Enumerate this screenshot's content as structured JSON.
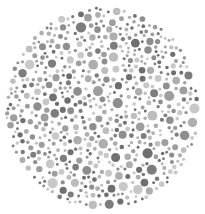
{
  "image": {
    "subject": "Ishihara-style dot plate (grayscale)",
    "caption": "Circular color-vision test plate made of gray dots",
    "width": 205,
    "height": 214
  },
  "plate": {
    "center_x": 102.5,
    "center_y": 108,
    "radius_x": 98,
    "radius_y": 102,
    "background": "#ffffff",
    "dot_colors": [
      "#6f6f6f",
      "#7d7d7d",
      "#8e8e8e",
      "#9e9e9e",
      "#aeaeae",
      "#bdbdbd",
      "#c8c8c8"
    ],
    "dot_radius_min": 1.4,
    "dot_radius_max": 5.2,
    "dot_gap": 0.9,
    "seed": 7,
    "attempts": 9000
  }
}
